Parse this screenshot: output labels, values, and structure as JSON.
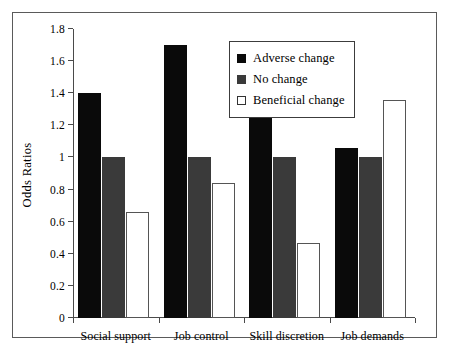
{
  "chart_data": {
    "type": "bar",
    "title": "",
    "xlabel": "",
    "ylabel": "Odds Ratios",
    "ylim": [
      0,
      1.8
    ],
    "ytick_step": 0.2,
    "ytick_labels": [
      "0",
      "0.2",
      "0.4",
      "0.6",
      "0.8",
      "1",
      "1.2",
      "1.4",
      "1.6",
      "1.8"
    ],
    "ytick_values": [
      0,
      0.2,
      0.4,
      0.6,
      0.8,
      1,
      1.2,
      1.4,
      1.6,
      1.8
    ],
    "grid": false,
    "legend_position": "top-right-inside",
    "categories": [
      "Social support",
      "Job control",
      "Skill discretion",
      "Job demands"
    ],
    "series": [
      {
        "name": "Adverse change",
        "color": "#0a0a0a",
        "values": [
          1.4,
          1.7,
          1.55,
          1.06
        ]
      },
      {
        "name": "No change",
        "color": "#3a3a3a",
        "values": [
          1.0,
          1.0,
          1.0,
          1.0
        ]
      },
      {
        "name": "Beneficial change",
        "color": "#ffffff",
        "values": [
          0.66,
          0.84,
          0.47,
          1.36
        ]
      }
    ]
  }
}
